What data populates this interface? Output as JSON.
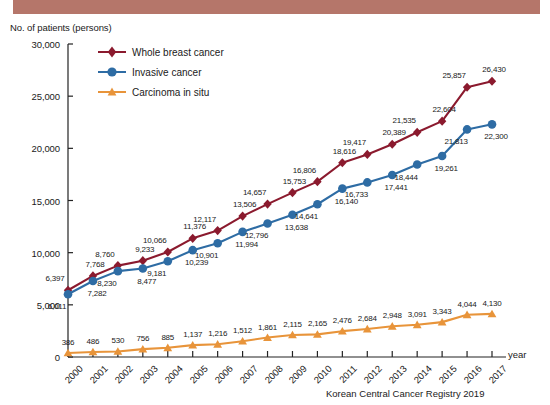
{
  "banner": {
    "color": "#b5766a"
  },
  "chart": {
    "y_axis_title": "No. of patients (persons)",
    "x_axis_title": "year",
    "source": "Korean Central Cancer Registry 2019"
  },
  "legend": {
    "items": [
      {
        "label": "Whole breast cancer",
        "color": "#8b1a2e",
        "marker": "diamond"
      },
      {
        "label": "Invasive cancer",
        "color": "#2e6ca4",
        "marker": "circle"
      },
      {
        "label": "Carcinoma in situ",
        "color": "#e8943a",
        "marker": "triangle"
      }
    ]
  },
  "chart_data": {
    "type": "line",
    "title": "",
    "xlabel": "year",
    "ylabel": "No. of patients (persons)",
    "grid": false,
    "legend_position": "top-center",
    "x": [
      "2000",
      "2001",
      "2002",
      "2003",
      "2004",
      "2005",
      "2006",
      "2007",
      "2008",
      "2009",
      "2010",
      "2011",
      "2012",
      "2013",
      "2014",
      "2015",
      "2016",
      "2017"
    ],
    "ylim": [
      0,
      30000
    ],
    "yticks": [
      0,
      5000,
      10000,
      15000,
      20000,
      25000,
      30000
    ],
    "ytick_labels": [
      "0",
      "5,000",
      "10,000",
      "15,000",
      "20,000",
      "25,000",
      "30,000"
    ],
    "series": [
      {
        "name": "Whole breast cancer",
        "color": "#8b1a2e",
        "marker": "diamond",
        "values": [
          6397,
          7768,
          8760,
          9233,
          10066,
          11376,
          12117,
          13506,
          14657,
          15753,
          16806,
          18616,
          19417,
          20389,
          21535,
          22604,
          25857,
          26430
        ],
        "labels": [
          "6,397",
          "7,768",
          "8,760",
          "9,233",
          "10,066",
          "11,376",
          "12,117",
          "13,506",
          "14,657",
          "15,753",
          "16,806",
          "18,616",
          "19,417",
          "20,389",
          "21,535",
          "22,604",
          "25,857",
          "26,430"
        ]
      },
      {
        "name": "Invasive cancer",
        "color": "#2e6ca4",
        "marker": "circle",
        "values": [
          6011,
          7282,
          8230,
          8477,
          9181,
          10239,
          10901,
          11994,
          12796,
          13638,
          14641,
          16140,
          16733,
          17441,
          18444,
          19261,
          21813,
          22300
        ],
        "labels": [
          "6,011",
          "7,282",
          "8,230",
          "8,477",
          "9,181",
          "10,239",
          "10,901",
          "11,994",
          "12,796",
          "13,638",
          "14,641",
          "16,140",
          "16,733",
          "17,441",
          "18,444",
          "19,261",
          "21,813",
          "22,300"
        ]
      },
      {
        "name": "Carcinoma in situ",
        "color": "#e8943a",
        "marker": "triangle",
        "values": [
          386,
          486,
          530,
          756,
          885,
          1137,
          1216,
          1512,
          1861,
          2115,
          2165,
          2476,
          2684,
          2948,
          3091,
          3343,
          4044,
          4130
        ],
        "labels": [
          "386",
          "486",
          "530",
          "756",
          "885",
          "1,137",
          "1,216",
          "1,512",
          "1,861",
          "2,115",
          "2,165",
          "2,476",
          "2,684",
          "2,948",
          "3,091",
          "3,343",
          "4,044",
          "4,130"
        ]
      }
    ]
  }
}
